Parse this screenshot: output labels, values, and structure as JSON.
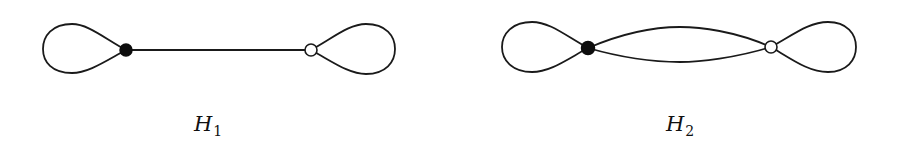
{
  "figure": {
    "graphs": [
      {
        "id": "H1",
        "label": {
          "main": "H",
          "sub": "1"
        },
        "vertices": [
          {
            "id": "v1",
            "style": "filled",
            "color": "#0d0d0d"
          },
          {
            "id": "v2",
            "style": "open",
            "color": "#ffffff"
          }
        ],
        "edges": [
          {
            "type": "loop",
            "at": "v1",
            "side": "left"
          },
          {
            "type": "straight",
            "from": "v1",
            "to": "v2"
          },
          {
            "type": "loop",
            "at": "v2",
            "side": "right"
          }
        ]
      },
      {
        "id": "H2",
        "label": {
          "main": "H",
          "sub": "2"
        },
        "vertices": [
          {
            "id": "v1",
            "style": "filled",
            "color": "#0d0d0d"
          },
          {
            "id": "v2",
            "style": "open",
            "color": "#ffffff"
          }
        ],
        "edges": [
          {
            "type": "loop",
            "at": "v1",
            "side": "left"
          },
          {
            "type": "curved",
            "from": "v1",
            "to": "v2",
            "bend": "up"
          },
          {
            "type": "curved",
            "from": "v1",
            "to": "v2",
            "bend": "down"
          },
          {
            "type": "loop",
            "at": "v2",
            "side": "right"
          }
        ]
      }
    ],
    "colors": {
      "stroke": "#1a1a1a",
      "background": "#ffffff"
    }
  }
}
